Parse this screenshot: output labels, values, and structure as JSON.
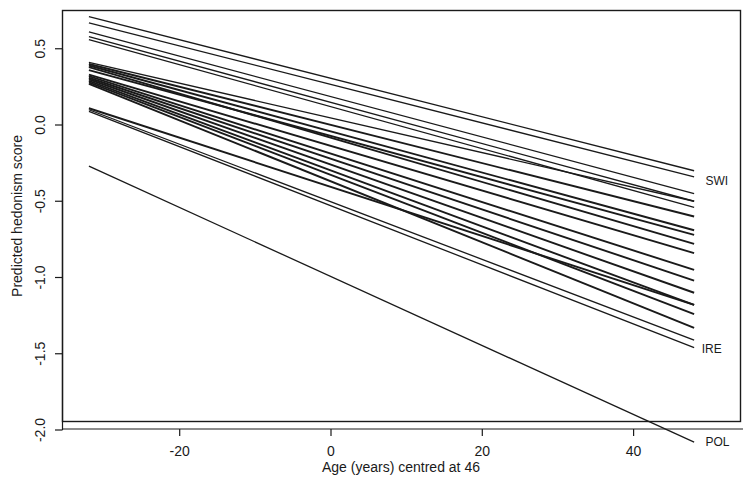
{
  "chart_data": {
    "type": "line",
    "title": "",
    "subtitle": "",
    "xlabel": "Age (years) centred at 46",
    "ylabel": "Predicted hedonism score",
    "xlim": [
      -34.5,
      53.5
    ],
    "ylim": [
      -2.2,
      0.78
    ],
    "grid": false,
    "legend_position": "right-inline-labels",
    "x_ticks": [
      -20,
      0,
      20,
      40
    ],
    "x_tick_labels": [
      "-20",
      "0",
      "20",
      "40"
    ],
    "y_ticks": [
      0.5,
      0.0,
      -0.5,
      -1.0,
      -1.5,
      -2.0
    ],
    "y_tick_labels": [
      "0.5",
      "0.0",
      "-0.5",
      "-1.0",
      "-1.5",
      "-2.0"
    ],
    "x_domain_of_lines": [
      -32,
      48
    ],
    "annotations": [
      {
        "text": "SWI",
        "x": 49.5,
        "y": -0.37
      },
      {
        "text": "IRE",
        "x": 49.0,
        "y": -1.47
      },
      {
        "text": "POL",
        "x": 49.5,
        "y": -2.08
      }
    ],
    "series": [
      {
        "name": "line-01",
        "label": "",
        "x": [
          -32,
          48
        ],
        "values": [
          0.71,
          -0.3
        ]
      },
      {
        "name": "line-02",
        "label": "SWI",
        "x": [
          -32,
          48
        ],
        "values": [
          0.67,
          -0.34
        ]
      },
      {
        "name": "line-03",
        "label": "",
        "x": [
          -32,
          48
        ],
        "values": [
          0.61,
          -0.45
        ]
      },
      {
        "name": "line-04",
        "label": "",
        "x": [
          -32,
          48
        ],
        "values": [
          0.58,
          -0.5
        ]
      },
      {
        "name": "line-05",
        "label": "",
        "x": [
          -32,
          48
        ],
        "values": [
          0.56,
          -0.54
        ]
      },
      {
        "name": "line-06",
        "label": "",
        "x": [
          -32,
          48
        ],
        "values": [
          0.41,
          -0.5
        ]
      },
      {
        "name": "line-07",
        "label": "",
        "x": [
          -32,
          48
        ],
        "values": [
          0.4,
          -0.6
        ]
      },
      {
        "name": "line-08",
        "label": "",
        "x": [
          -32,
          48
        ],
        "values": [
          0.39,
          -0.69
        ]
      },
      {
        "name": "line-09",
        "label": "",
        "x": [
          -32,
          48
        ],
        "values": [
          0.38,
          -0.78
        ]
      },
      {
        "name": "line-10",
        "label": "",
        "x": [
          -32,
          48
        ],
        "values": [
          0.36,
          -0.72
        ]
      },
      {
        "name": "line-11",
        "label": "",
        "x": [
          -32,
          48
        ],
        "values": [
          0.33,
          -0.84
        ]
      },
      {
        "name": "line-12",
        "label": "",
        "x": [
          -32,
          48
        ],
        "values": [
          0.32,
          -0.95
        ]
      },
      {
        "name": "line-13",
        "label": "",
        "x": [
          -32,
          48
        ],
        "values": [
          0.31,
          -1.02
        ]
      },
      {
        "name": "line-14",
        "label": "",
        "x": [
          -32,
          48
        ],
        "values": [
          0.3,
          -1.1
        ]
      },
      {
        "name": "line-15",
        "label": "",
        "x": [
          -32,
          48
        ],
        "values": [
          0.29,
          -1.18
        ]
      },
      {
        "name": "line-16",
        "label": "",
        "x": [
          -32,
          48
        ],
        "values": [
          0.28,
          -1.24
        ]
      },
      {
        "name": "line-17",
        "label": "",
        "x": [
          -32,
          48
        ],
        "values": [
          0.27,
          -1.33
        ]
      },
      {
        "name": "line-18",
        "label": "",
        "x": [
          -32,
          48
        ],
        "values": [
          0.11,
          -1.18
        ]
      },
      {
        "name": "line-19",
        "label": "",
        "x": [
          -32,
          48
        ],
        "values": [
          0.1,
          -1.41
        ]
      },
      {
        "name": "line-20",
        "label": "IRE",
        "x": [
          -32,
          48
        ],
        "values": [
          0.09,
          -1.46
        ]
      },
      {
        "name": "line-21",
        "label": "POL",
        "x": [
          -32,
          48
        ],
        "values": [
          -0.27,
          -2.08
        ]
      }
    ]
  },
  "figure": {
    "background_color": "#ffffff",
    "line_color": "#1a1a1a",
    "axis_color": "#1a1a1a"
  }
}
